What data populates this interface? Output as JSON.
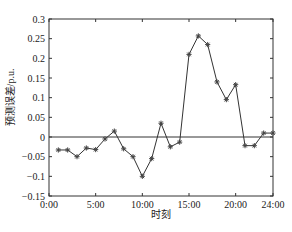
{
  "chart_data": {
    "type": "line",
    "title": "",
    "xlabel": "时刻",
    "ylabel": "预测误差/p.u.",
    "x_ticks": [
      "0:00",
      "5:00",
      "10:00",
      "15:00",
      "20:00",
      "24:00"
    ],
    "x_tick_hours": [
      0,
      5,
      10,
      15,
      20,
      24
    ],
    "y_ticks": [
      0.3,
      0.25,
      0.2,
      0.15,
      0.1,
      0.05,
      0,
      -0.05,
      -0.1,
      -0.15
    ],
    "y_tick_labels": [
      "0.3",
      "0.25",
      "0.2",
      "0.15",
      "0.1",
      "0.05",
      "0",
      "−0.05",
      "−0.1",
      "−0.15"
    ],
    "xlim": [
      0,
      24
    ],
    "ylim": [
      -0.15,
      0.3
    ],
    "grid": false,
    "zero_line": true,
    "marker": "asterisk",
    "line_color": "#333333",
    "x": [
      1,
      2,
      3,
      4,
      5,
      6,
      7,
      8,
      9,
      10,
      11,
      12,
      13,
      14,
      15,
      16,
      17,
      18,
      19,
      20,
      21,
      22,
      23,
      24
    ],
    "values": [
      -0.033,
      -0.033,
      -0.05,
      -0.028,
      -0.032,
      -0.005,
      0.015,
      -0.03,
      -0.05,
      -0.1,
      -0.055,
      0.035,
      -0.025,
      -0.013,
      0.21,
      0.257,
      0.235,
      0.14,
      0.095,
      0.133,
      -0.022,
      -0.022,
      0.01,
      0.01
    ]
  }
}
